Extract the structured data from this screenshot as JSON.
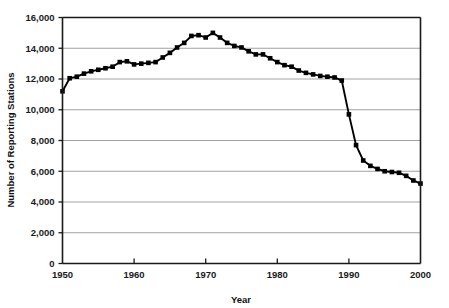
{
  "chart_data": {
    "type": "line",
    "title": "",
    "xlabel": "Year",
    "ylabel": "Number of Reporting Stations",
    "xlim": [
      1950,
      2000
    ],
    "ylim": [
      0,
      16000
    ],
    "grid": true,
    "legend": "none",
    "marker": "square",
    "xticks": [
      1950,
      1960,
      1970,
      1980,
      1990,
      2000
    ],
    "xtick_labels": [
      "1950",
      "1960",
      "1970",
      "1980",
      "1990",
      "2000"
    ],
    "yticks": [
      0,
      2000,
      4000,
      6000,
      8000,
      10000,
      12000,
      14000,
      16000
    ],
    "ytick_labels": [
      "0",
      "2,000",
      "4,000",
      "6,000",
      "8,000",
      "10,000",
      "12,000",
      "14,000",
      "16,000"
    ],
    "series": [
      {
        "name": "Reporting Stations",
        "color": "#000000",
        "x": [
          1950,
          1951,
          1952,
          1953,
          1954,
          1955,
          1956,
          1957,
          1958,
          1959,
          1960,
          1961,
          1962,
          1963,
          1964,
          1965,
          1966,
          1967,
          1968,
          1969,
          1970,
          1971,
          1972,
          1973,
          1974,
          1975,
          1976,
          1977,
          1978,
          1979,
          1980,
          1981,
          1982,
          1983,
          1984,
          1985,
          1986,
          1987,
          1988,
          1989,
          1990,
          1991,
          1992,
          1993,
          1994,
          1995,
          1996,
          1997,
          1998,
          1999,
          2000
        ],
        "values": [
          11200,
          12050,
          12150,
          12350,
          12500,
          12600,
          12700,
          12800,
          13100,
          13150,
          12950,
          13000,
          13050,
          13100,
          13400,
          13700,
          14050,
          14350,
          14800,
          14850,
          14700,
          15000,
          14700,
          14350,
          14150,
          14050,
          13800,
          13600,
          13600,
          13350,
          13100,
          12900,
          12800,
          12550,
          12400,
          12300,
          12200,
          12150,
          12100,
          11900,
          9700,
          7700,
          6700,
          6350,
          6150,
          6000,
          5950,
          5900,
          5700,
          5400,
          5200
        ]
      }
    ]
  },
  "axis": {
    "x_title": "Year",
    "y_title": "Number of Reporting Stations"
  }
}
